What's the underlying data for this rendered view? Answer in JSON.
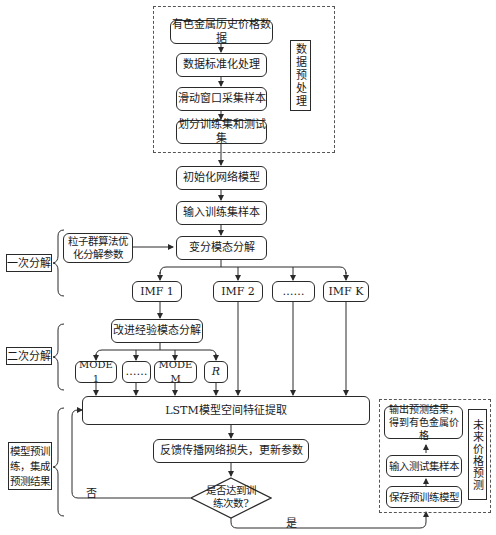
{
  "preprocess": {
    "group_label": "数据预处理",
    "steps": [
      "有色金属历史价格数据",
      "数据标准化处理",
      "滑动窗口采集样本",
      "划分训练集和测试集"
    ]
  },
  "main_flow": {
    "init_model": "初始化网络模型",
    "input_train": "输入训练集样本",
    "vmd": "变分模态分解",
    "pso": "粒子群算法优化分解参数"
  },
  "first_decomposition": {
    "label": "一次分解",
    "imfs": [
      "IMF 1",
      "IMF 2",
      "……",
      "IMF K"
    ]
  },
  "second_decomposition": {
    "label": "二次分解",
    "method": "改进经验模态分解",
    "modes": [
      "MODE 1",
      "……",
      "MODE M",
      "R"
    ]
  },
  "pretrain": {
    "label": "模型预训练，集成预测结果",
    "lstm": "LSTM模型空间特征提取",
    "backprop": "反馈传播网络损失，更新参数",
    "decision": "是否达到训练次数?",
    "no_label": "否",
    "yes_label": "是"
  },
  "forecast": {
    "group_label": "未来价格预测",
    "steps": [
      "输出预测结果，得到有色金属价格",
      "输入测试集样本",
      "保存预训练模型"
    ]
  }
}
